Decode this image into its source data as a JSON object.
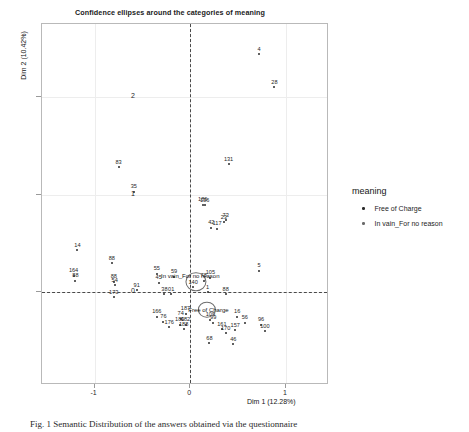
{
  "chart_data": {
    "type": "scatter",
    "title": "Confidence ellipses around the categories of meaning",
    "xlabel": "Dim 1 (12.28%)",
    "ylabel": "Dim 2 (10.42%)",
    "xlim": [
      -1.55,
      1.45
    ],
    "ylim": [
      -0.95,
      2.75
    ],
    "xticks": [
      -1,
      0,
      1
    ],
    "xtick_labels": [
      "-1",
      "0",
      "1"
    ],
    "yticks": [
      0,
      1,
      2
    ],
    "ytick_labels": [
      "0",
      "1",
      "2"
    ],
    "grid": true,
    "reference_lines": {
      "x": 0,
      "y": 0,
      "style": "dashed"
    },
    "legend": {
      "title": "meaning",
      "position": "right",
      "entries": [
        {
          "label": "Free of Charge",
          "color": "#2b2b2b"
        },
        {
          "label": "In vain_For no reason",
          "color": "#6a6a6a"
        }
      ]
    },
    "categories": [
      {
        "name": "Free of Charge",
        "label_x": 0.19,
        "label_y": -0.18,
        "ellipse": {
          "cx": 0.17,
          "cy": -0.18,
          "rx": 0.085,
          "ry": 0.075
        }
      },
      {
        "name": "In vain_For no reason",
        "label_x": 0.0,
        "label_y": 0.17,
        "ellipse": {
          "cx": 0.06,
          "cy": 0.11,
          "rx": 0.1,
          "ry": 0.09
        }
      }
    ],
    "series": [
      {
        "name": "Free of Charge",
        "color": "#2b2b2b",
        "points": [
          {
            "label": "4",
            "x": 0.72,
            "y": 2.44
          },
          {
            "label": "28",
            "x": 0.88,
            "y": 2.1
          },
          {
            "label": "131",
            "x": 0.4,
            "y": 1.31
          },
          {
            "label": "83",
            "x": -0.75,
            "y": 1.28
          },
          {
            "label": "35",
            "x": -0.59,
            "y": 1.03
          },
          {
            "label": "186",
            "x": 0.13,
            "y": 0.9
          },
          {
            "label": "136",
            "x": 0.15,
            "y": 0.89
          },
          {
            "label": "73",
            "x": 0.37,
            "y": 0.74
          },
          {
            "label": "23",
            "x": 0.35,
            "y": 0.72
          },
          {
            "label": "42",
            "x": 0.22,
            "y": 0.66
          },
          {
            "label": "117",
            "x": 0.28,
            "y": 0.65
          },
          {
            "label": "5",
            "x": 0.72,
            "y": 0.22
          },
          {
            "label": "14",
            "x": -1.18,
            "y": 0.43
          },
          {
            "label": "88",
            "x": -0.82,
            "y": 0.3
          },
          {
            "label": "164",
            "x": -1.22,
            "y": 0.17
          },
          {
            "label": "88",
            "x": -1.2,
            "y": 0.12
          },
          {
            "label": "54",
            "x": -0.79,
            "y": 0.07
          },
          {
            "label": "88",
            "x": -0.8,
            "y": 0.11
          },
          {
            "label": "173",
            "x": -0.8,
            "y": -0.05
          },
          {
            "label": "91",
            "x": -0.56,
            "y": 0.02
          },
          {
            "label": "55",
            "x": -0.35,
            "y": 0.19
          },
          {
            "label": "45",
            "x": -0.33,
            "y": 0.1
          },
          {
            "label": "59",
            "x": -0.17,
            "y": 0.16
          },
          {
            "label": "38",
            "x": -0.27,
            "y": -0.02
          },
          {
            "label": "01",
            "x": -0.2,
            "y": -0.02
          },
          {
            "label": "140",
            "x": 0.03,
            "y": 0.05
          },
          {
            "label": "78",
            "x": 0.14,
            "y": 0.12
          },
          {
            "label": "105",
            "x": 0.21,
            "y": 0.15
          },
          {
            "label": "1",
            "x": 0.18,
            "y": 0.0
          },
          {
            "label": "88",
            "x": 0.37,
            "y": -0.02
          },
          {
            "label": "166",
            "x": -0.35,
            "y": -0.25
          },
          {
            "label": "76",
            "x": -0.28,
            "y": -0.3
          },
          {
            "label": "176",
            "x": -0.22,
            "y": -0.36
          },
          {
            "label": "74",
            "x": -0.1,
            "y": -0.27
          },
          {
            "label": "187",
            "x": -0.05,
            "y": -0.22
          },
          {
            "label": "182",
            "x": -0.05,
            "y": -0.33
          },
          {
            "label": "189",
            "x": -0.11,
            "y": -0.33
          },
          {
            "label": "188",
            "x": -0.07,
            "y": -0.38
          },
          {
            "label": "109",
            "x": 0.21,
            "y": -0.28
          },
          {
            "label": "99",
            "x": 0.24,
            "y": -0.31
          },
          {
            "label": "16",
            "x": 0.49,
            "y": -0.25
          },
          {
            "label": "56",
            "x": 0.57,
            "y": -0.31
          },
          {
            "label": "161",
            "x": 0.33,
            "y": -0.38
          },
          {
            "label": "157",
            "x": 0.47,
            "y": -0.39
          },
          {
            "label": "170",
            "x": 0.37,
            "y": -0.42
          },
          {
            "label": "68",
            "x": 0.2,
            "y": -0.52
          },
          {
            "label": "46",
            "x": 0.45,
            "y": -0.53
          },
          {
            "label": "96",
            "x": 0.74,
            "y": -0.33
          },
          {
            "label": "100",
            "x": 0.78,
            "y": -0.4
          }
        ]
      }
    ]
  },
  "caption": {
    "prefix": "Fig. 1",
    "text": "Fig. 1   Semantic Distribution of the answers obtained via the questionnaire"
  }
}
